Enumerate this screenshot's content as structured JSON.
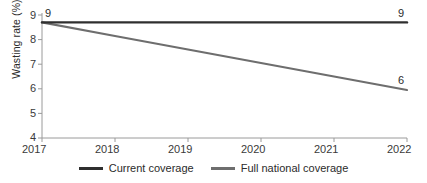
{
  "chart_data": {
    "type": "line",
    "title": "",
    "xlabel": "",
    "ylabel": "Wasting rate (%)",
    "x": [
      2017,
      2018,
      2019,
      2020,
      2021,
      2022
    ],
    "xtick_labels": [
      "2017",
      "2018",
      "2019",
      "2020",
      "2021",
      "2022"
    ],
    "ytick_labels": [
      "9",
      "8",
      "7",
      "6",
      "5",
      "4"
    ],
    "yticks": [
      9,
      8,
      7,
      6,
      5,
      4
    ],
    "ylim": [
      4,
      9
    ],
    "xlim": [
      2017,
      2022
    ],
    "grid": false,
    "legend_position": "bottom-center",
    "series": [
      {
        "name": "Current coverage",
        "color": "#2f2f2f",
        "values": [
          8.7,
          8.7,
          8.7,
          8.7,
          8.7,
          8.7
        ],
        "start_label": "9",
        "end_label": "9"
      },
      {
        "name": "Full national coverage",
        "color": "#6e6e6e",
        "values": [
          8.7,
          8.15,
          7.6,
          7.05,
          6.5,
          5.95
        ],
        "start_label": "",
        "end_label": "6"
      }
    ],
    "annotations": [
      {
        "text": "9",
        "series": "Current coverage",
        "at_x": 2017
      },
      {
        "text": "9",
        "series": "Current coverage",
        "at_x": 2022
      },
      {
        "text": "6",
        "series": "Full national coverage",
        "at_x": 2022
      }
    ]
  },
  "legend": {
    "items": [
      {
        "label": "Current coverage",
        "color": "#2f2f2f"
      },
      {
        "label": "Full national coverage",
        "color": "#6e6e6e"
      }
    ]
  },
  "axes": {
    "y_title": "Wasting rate (%)",
    "y_ticks": [
      "9",
      "8",
      "7",
      "6",
      "5",
      "4"
    ],
    "x_ticks": [
      "2017",
      "2018",
      "2019",
      "2020",
      "2021",
      "2022"
    ]
  },
  "colors": {
    "axis": "#9a9a9a",
    "text": "#2b2b2b",
    "series_current": "#2f2f2f",
    "series_full": "#6e6e6e",
    "background": "#ffffff"
  }
}
